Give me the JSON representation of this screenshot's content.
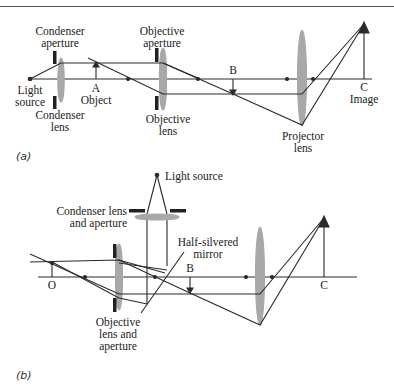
{
  "figure": {
    "panel_a": {
      "tag": "(a)",
      "labels": {
        "condenser_aperture": "Condenser aperture",
        "condenser_aperture_l1": "Condenser",
        "condenser_aperture_l2": "aperture",
        "light_source_l1": "Light",
        "light_source_l2": "source",
        "condenser_lens_l1": "Condenser",
        "condenser_lens_l2": "lens",
        "object_letter": "A",
        "object": "Object",
        "objective_aperture_l1": "Objective",
        "objective_aperture_l2": "aperture",
        "objective_lens_l1": "Objective",
        "objective_lens_l2": "lens",
        "intermediate_letter": "B",
        "projector_lens_l1": "Projector",
        "projector_lens_l2": "lens",
        "image_letter": "C",
        "image": "Image"
      }
    },
    "panel_b": {
      "tag": "(b)",
      "labels": {
        "light_source": "Light source",
        "condenser_l1": "Condenser lens",
        "condenser_l2": "and aperture",
        "mirror_l1": "Half-silvered",
        "mirror_l2": "mirror",
        "object_letter": "O",
        "intermediate_letter": "B",
        "objective_l1": "Objective",
        "objective_l2": "lens and",
        "objective_l3": "aperture",
        "image_letter": "C"
      }
    },
    "colors": {
      "line": "#2a2a2a",
      "lens_fill": "#a8a8a8",
      "aperture": "#222222"
    }
  }
}
